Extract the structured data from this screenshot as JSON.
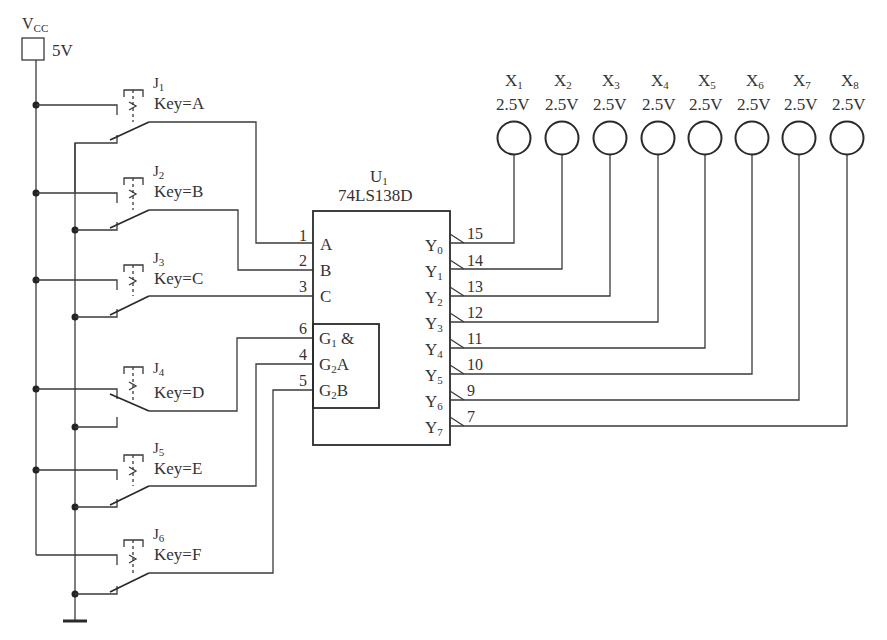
{
  "power": {
    "name": "V",
    "name_sub": "CC",
    "value": "5V"
  },
  "switches": [
    {
      "id": "J",
      "sub": "1",
      "key": "Key=A",
      "state": "ground"
    },
    {
      "id": "J",
      "sub": "2",
      "key": "Key=B",
      "state": "ground"
    },
    {
      "id": "J",
      "sub": "3",
      "key": "Key=C",
      "state": "ground"
    },
    {
      "id": "J",
      "sub": "4",
      "key": "Key=D",
      "state": "vcc"
    },
    {
      "id": "J",
      "sub": "5",
      "key": "Key=E",
      "state": "ground"
    },
    {
      "id": "J",
      "sub": "6",
      "key": "Key=F",
      "state": "ground"
    }
  ],
  "chip": {
    "ref": "U",
    "ref_sub": "1",
    "part": "74LS138D",
    "inputs": [
      {
        "pin": "1",
        "name": "A",
        "sub": ""
      },
      {
        "pin": "2",
        "name": "B",
        "sub": ""
      },
      {
        "pin": "3",
        "name": "C",
        "sub": ""
      },
      {
        "pin": "6",
        "name": "G",
        "sub": "1",
        "extra": "&"
      },
      {
        "pin": "4",
        "name": "G",
        "sub": "2",
        "extra": "A"
      },
      {
        "pin": "5",
        "name": "G",
        "sub": "2",
        "extra": "B"
      }
    ],
    "outputs": [
      {
        "pin": "15",
        "name": "Y",
        "sub": "0"
      },
      {
        "pin": "14",
        "name": "Y",
        "sub": "1"
      },
      {
        "pin": "13",
        "name": "Y",
        "sub": "2"
      },
      {
        "pin": "12",
        "name": "Y",
        "sub": "3"
      },
      {
        "pin": "11",
        "name": "Y",
        "sub": "4"
      },
      {
        "pin": "10",
        "name": "Y",
        "sub": "5"
      },
      {
        "pin": "9",
        "name": "Y",
        "sub": "6"
      },
      {
        "pin": "7",
        "name": "Y",
        "sub": "7"
      }
    ]
  },
  "probes": [
    {
      "id": "X",
      "sub": "1",
      "voltage": "2.5V"
    },
    {
      "id": "X",
      "sub": "2",
      "voltage": "2.5V"
    },
    {
      "id": "X",
      "sub": "3",
      "voltage": "2.5V"
    },
    {
      "id": "X",
      "sub": "4",
      "voltage": "2.5V"
    },
    {
      "id": "X",
      "sub": "5",
      "voltage": "2.5V"
    },
    {
      "id": "X",
      "sub": "6",
      "voltage": "2.5V"
    },
    {
      "id": "X",
      "sub": "7",
      "voltage": "2.5V"
    },
    {
      "id": "X",
      "sub": "8",
      "voltage": "2.5V"
    }
  ]
}
